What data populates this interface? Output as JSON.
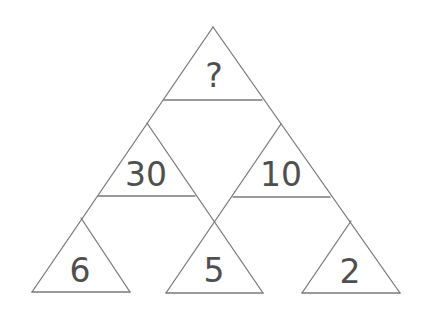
{
  "diagram": {
    "type": "number-triangle-puzzle",
    "colors": {
      "background": "#ffffff",
      "lines": "#7a7a7a",
      "text": "#4f4f4f"
    },
    "triangles": {
      "top": {
        "label": "?"
      },
      "middle_left": {
        "label": "30"
      },
      "middle_right": {
        "label": "10"
      },
      "bottom_left": {
        "label": "6"
      },
      "bottom_middle": {
        "label": "5"
      },
      "bottom_right": {
        "label": "2"
      }
    }
  }
}
